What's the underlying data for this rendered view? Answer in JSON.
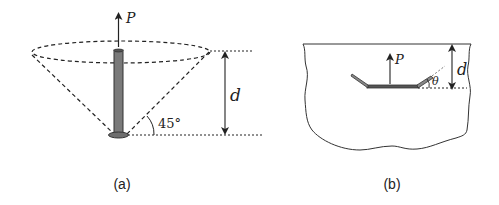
{
  "figure_a": {
    "caption": "(a)",
    "force_label": "P",
    "depth_label": "d",
    "angle_label": "45°",
    "colors": {
      "rod": "#7a7a7a",
      "line": "#222222"
    }
  },
  "figure_b": {
    "caption": "(b)",
    "force_label": "P",
    "depth_label": "d",
    "angle_label": "θ",
    "colors": {
      "plate": "#555555",
      "line": "#222222"
    }
  }
}
